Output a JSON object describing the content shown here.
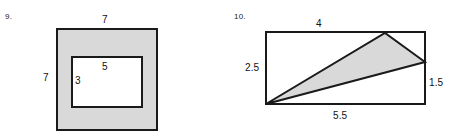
{
  "page": {
    "type": "geometry-worksheet",
    "background_color": "#ffffff",
    "ink_color": "#1a1a1a",
    "shaded_fill_color": "#d9d9d9",
    "unshaded_fill_color": "#ffffff"
  },
  "problems": [
    {
      "number": "9.",
      "figure": "shaded-square-with-rectangular-hole",
      "labels": {
        "outer_top": "7",
        "outer_left": "7",
        "inner_top": "5",
        "inner_left": "3"
      }
    },
    {
      "number": "10.",
      "figure": "rectangle-with-inscribed-shaded-triangle",
      "labels": {
        "top_segment": "4",
        "left_side": "2.5",
        "right_segment": "1.5",
        "bottom_side": "5.5"
      }
    }
  ]
}
